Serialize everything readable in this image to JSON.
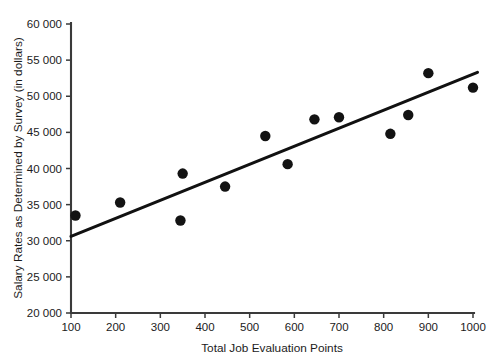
{
  "chart_data": {
    "type": "scatter",
    "title": "",
    "xlabel": "Total Job Evaluation Points",
    "ylabel": "Salary Rates as Determined by Survey (in dollars)",
    "xlim": [
      100,
      1000
    ],
    "ylim": [
      20000,
      60000
    ],
    "grid": false,
    "legend": null,
    "x_ticks": [
      100,
      200,
      300,
      400,
      500,
      600,
      700,
      800,
      900,
      1000
    ],
    "x_tick_labels": [
      "100",
      "200",
      "300",
      "400",
      "500",
      "600",
      "700",
      "800",
      "900",
      "1000"
    ],
    "y_ticks": [
      20000,
      25000,
      30000,
      35000,
      40000,
      45000,
      50000,
      55000,
      60000
    ],
    "y_tick_labels": [
      "20 000",
      "25 000",
      "30 000",
      "35 000",
      "40 000",
      "45 000",
      "50 000",
      "55 000",
      "60 000"
    ],
    "series": [
      {
        "name": "Job evaluation points vs survey salary",
        "type": "scatter",
        "marker": "filled-circle",
        "color": "#131313",
        "points": [
          {
            "x": 110,
            "y": 33500
          },
          {
            "x": 210,
            "y": 35300
          },
          {
            "x": 345,
            "y": 32800
          },
          {
            "x": 350,
            "y": 39300
          },
          {
            "x": 445,
            "y": 37500
          },
          {
            "x": 535,
            "y": 44500
          },
          {
            "x": 585,
            "y": 40600
          },
          {
            "x": 645,
            "y": 46800
          },
          {
            "x": 700,
            "y": 47100
          },
          {
            "x": 815,
            "y": 44800
          },
          {
            "x": 855,
            "y": 47400
          },
          {
            "x": 900,
            "y": 53200
          },
          {
            "x": 1000,
            "y": 51200
          }
        ]
      },
      {
        "name": "Trend line",
        "type": "line",
        "color": "#111111",
        "points": [
          {
            "x": 100,
            "y": 30600
          },
          {
            "x": 1010,
            "y": 53300
          }
        ]
      }
    ]
  },
  "colors": {
    "background": "#ffffff",
    "axis": "#3a3a3a",
    "marker": "#131313",
    "trend": "#111111",
    "text": "#1b1b1b"
  }
}
